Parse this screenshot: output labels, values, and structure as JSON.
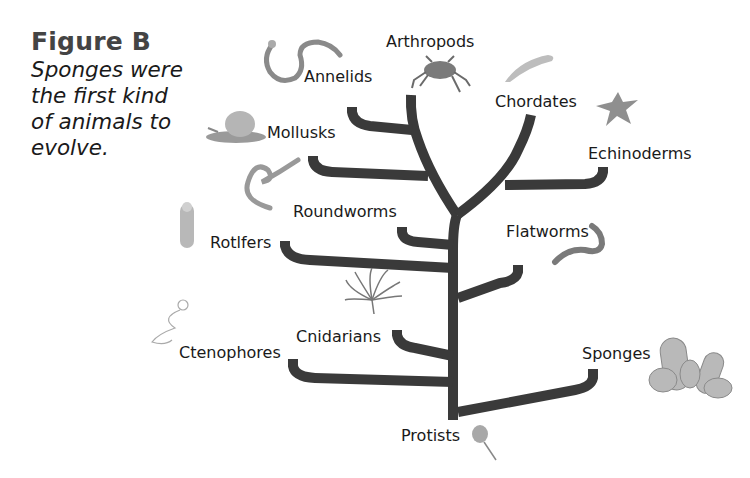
{
  "caption": {
    "title": "Figure B",
    "text_lines": [
      "Sponges were",
      "the first kind",
      "of animals to",
      "evolve."
    ]
  },
  "tree": {
    "root_label": "Protists",
    "branch_color": "#3a3a3a",
    "groups": [
      {
        "label": "Arthropods",
        "icon": "crab-icon"
      },
      {
        "label": "Annelids",
        "icon": "segmented-worm-icon"
      },
      {
        "label": "Chordates",
        "icon": "fish-icon"
      },
      {
        "label": "Mollusks",
        "icon": "snail-icon"
      },
      {
        "label": "Echinoderms",
        "icon": "starfish-icon"
      },
      {
        "label": "Roundworms",
        "icon": "roundworm-icon"
      },
      {
        "label": "Rotlfers",
        "icon": "rotifer-icon"
      },
      {
        "label": "Flatworms",
        "icon": "flatworm-icon"
      },
      {
        "label": "Cnidarians",
        "icon": "sea-anemone-icon"
      },
      {
        "label": "Ctenophores",
        "icon": "comb-jelly-icon"
      },
      {
        "label": "Sponges",
        "icon": "sponge-icon"
      }
    ]
  }
}
